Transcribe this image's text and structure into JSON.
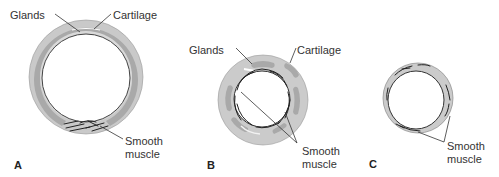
{
  "figure": {
    "colors": {
      "outer_ring": "#c8c8c8",
      "cartilage": "#a8a8a8",
      "inner_ring": "#d6d6d6",
      "lumen": "#ffffff",
      "outline": "#555555",
      "muscle": "#222222",
      "text": "#333333"
    },
    "panels": [
      {
        "id": "A",
        "letter": "A",
        "labels": {
          "glands": "Glands",
          "cartilage": "Cartilage",
          "smooth_muscle_line1": "Smooth",
          "smooth_muscle_line2": "muscle"
        }
      },
      {
        "id": "B",
        "letter": "B",
        "labels": {
          "glands": "Glands",
          "cartilage": "Cartilage",
          "smooth_muscle_line1": "Smooth",
          "smooth_muscle_line2": "muscle"
        }
      },
      {
        "id": "C",
        "letter": "C",
        "labels": {
          "smooth_muscle_line1": "Smooth",
          "smooth_muscle_line2": "muscle"
        }
      }
    ]
  }
}
